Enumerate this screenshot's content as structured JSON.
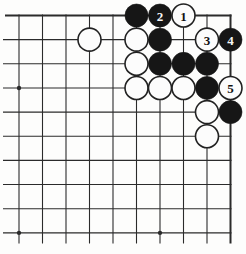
{
  "diagram": {
    "kind": "go-board-problem-diagram",
    "colors": {
      "background": "#fdfdfc",
      "line": "#2b2b2b",
      "black_stone": "#161616",
      "white_stone": "#fcfcfc",
      "white_stone_outline": "#222222",
      "number_on_black": "#f5f5f5",
      "number_on_white": "#111111"
    }
  },
  "board": {
    "visible_cols": 10,
    "visible_rows": 10,
    "origin_x": 19,
    "origin_y": 15.5,
    "col_spacing": 23.5,
    "row_spacing": 24.15,
    "h_line_start_x": 3,
    "h_line_start_x_top": 5,
    "h_line_end_x": 231.5,
    "v_line_end_y": 243.5,
    "edge_top": true,
    "edge_right": true,
    "edge_line_width": 2,
    "inner_line_width": 1.1,
    "stone_radius": 11.5,
    "star_point_radius": 2.2,
    "star_points": [
      {
        "col": 1,
        "row": 4
      },
      {
        "col": 1,
        "row": 10
      },
      {
        "col": 7,
        "row": 10
      }
    ],
    "stones": [
      {
        "col": 6,
        "row": 1,
        "color": "black",
        "label": ""
      },
      {
        "col": 7,
        "row": 1,
        "color": "black",
        "label": "2"
      },
      {
        "col": 8,
        "row": 1,
        "color": "white",
        "label": "1"
      },
      {
        "col": 4,
        "row": 2,
        "color": "white",
        "label": ""
      },
      {
        "col": 6,
        "row": 2,
        "color": "white",
        "label": ""
      },
      {
        "col": 7,
        "row": 2,
        "color": "black",
        "label": ""
      },
      {
        "col": 9,
        "row": 2,
        "color": "white",
        "label": "3"
      },
      {
        "col": 10,
        "row": 2,
        "color": "black",
        "label": "4"
      },
      {
        "col": 6,
        "row": 3,
        "color": "white",
        "label": ""
      },
      {
        "col": 7,
        "row": 3,
        "color": "black",
        "label": ""
      },
      {
        "col": 8,
        "row": 3,
        "color": "black",
        "label": ""
      },
      {
        "col": 9,
        "row": 3,
        "color": "black",
        "label": ""
      },
      {
        "col": 6,
        "row": 4,
        "color": "white",
        "label": ""
      },
      {
        "col": 7,
        "row": 4,
        "color": "white",
        "label": ""
      },
      {
        "col": 8,
        "row": 4,
        "color": "white",
        "label": ""
      },
      {
        "col": 9,
        "row": 4,
        "color": "black",
        "label": ""
      },
      {
        "col": 10,
        "row": 4,
        "color": "white",
        "label": "5"
      },
      {
        "col": 9,
        "row": 5,
        "color": "white",
        "label": ""
      },
      {
        "col": 10,
        "row": 5,
        "color": "black",
        "label": ""
      },
      {
        "col": 9,
        "row": 6,
        "color": "white",
        "label": ""
      }
    ],
    "move_labels_visible": [
      "1",
      "2",
      "3",
      "4",
      "5"
    ],
    "number_font_size": 13
  }
}
